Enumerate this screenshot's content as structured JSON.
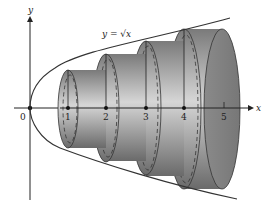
{
  "diagram": {
    "equation_label": "y = √x",
    "axes": {
      "x_label": "x",
      "y_label": "y",
      "origin_label": "0",
      "ticks": [
        "1",
        "2",
        "3",
        "4",
        "5"
      ]
    },
    "cylinders": [
      {
        "index": 1,
        "center_x": 1
      },
      {
        "index": 2,
        "center_x": 2
      },
      {
        "index": 3,
        "center_x": 3
      },
      {
        "index": 4,
        "center_x": 4
      }
    ],
    "colors": {
      "curve": "#333333",
      "cylinder_dark": "#6e6e6e",
      "cylinder_light": "#d4d4d4",
      "axis": "#222222"
    }
  }
}
